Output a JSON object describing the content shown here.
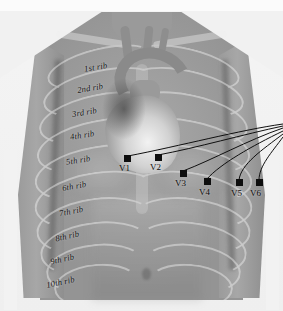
{
  "figure": {
    "kind": "anatomical-illustration",
    "color_scheme": {
      "background": "#f2f2f2",
      "skin": "#9d9d9d",
      "bone_overlay": "#eeeeee",
      "electrode": "#0e0e0e",
      "lead_wire": "#101010",
      "label_text": "#141414"
    }
  },
  "rib_labels": [
    {
      "text": "1st rib",
      "x": 84,
      "y": 62,
      "rotate": -9
    },
    {
      "text": "2nd rib",
      "x": 77,
      "y": 83,
      "rotate": -9
    },
    {
      "text": "3rd rib",
      "x": 72,
      "y": 107,
      "rotate": -9
    },
    {
      "text": "4th rib",
      "x": 70,
      "y": 130,
      "rotate": -9
    },
    {
      "text": "5th rib",
      "x": 66,
      "y": 155,
      "rotate": -9
    },
    {
      "text": "6th rib",
      "x": 62,
      "y": 181,
      "rotate": -10
    },
    {
      "text": "7th rib",
      "x": 59,
      "y": 206,
      "rotate": -11
    },
    {
      "text": "8th rib",
      "x": 55,
      "y": 231,
      "rotate": -12
    },
    {
      "text": "9th rib",
      "x": 50,
      "y": 254,
      "rotate": -12
    },
    {
      "text": "10th rib",
      "x": 46,
      "y": 277,
      "rotate": -12
    }
  ],
  "electrodes": [
    {
      "id": "V1",
      "label": "V1",
      "x": 124,
      "y": 155,
      "label_x": 119,
      "label_y": 163
    },
    {
      "id": "V2",
      "label": "V2",
      "x": 155,
      "y": 154,
      "label_x": 150,
      "label_y": 162
    },
    {
      "id": "V3",
      "label": "V3",
      "x": 180,
      "y": 170,
      "label_x": 175,
      "label_y": 178
    },
    {
      "id": "V4",
      "label": "V4",
      "x": 204,
      "y": 178,
      "label_x": 199,
      "label_y": 187
    },
    {
      "id": "V5",
      "label": "V5",
      "x": 236,
      "y": 179,
      "label_x": 231,
      "label_y": 188
    },
    {
      "id": "V6",
      "label": "V6",
      "x": 256,
      "y": 179,
      "label_x": 250,
      "label_y": 188
    }
  ],
  "lead_wires": {
    "converge_point": {
      "x": 283,
      "y": 125
    },
    "paths": [
      "M 283 124 C 240 130, 180 146, 128 156",
      "M 283 126 C 245 134, 196 148, 158 155",
      "M 283 128 C 248 140, 212 160, 183 171",
      "M 283 131 C 252 146, 220 164, 207 179",
      "M 283 134 C 262 150, 241 164, 239 180",
      "M 283 137 C 272 152, 259 166, 259 180"
    ]
  },
  "ribcage_arcs": {
    "left": [
      {
        "x": 6,
        "y": 18,
        "w": 104,
        "h": 34,
        "rot": -14
      },
      {
        "x": 2,
        "y": 40,
        "w": 112,
        "h": 40,
        "rot": -13
      },
      {
        "x": -2,
        "y": 64,
        "w": 118,
        "h": 44,
        "rot": -12
      },
      {
        "x": -4,
        "y": 90,
        "w": 122,
        "h": 48,
        "rot": -11
      },
      {
        "x": -6,
        "y": 116,
        "w": 124,
        "h": 50,
        "rot": -10
      },
      {
        "x": -6,
        "y": 142,
        "w": 122,
        "h": 52,
        "rot": -9
      },
      {
        "x": -4,
        "y": 168,
        "w": 116,
        "h": 52,
        "rot": -8
      },
      {
        "x": 0,
        "y": 192,
        "w": 108,
        "h": 50,
        "rot": -7
      },
      {
        "x": 6,
        "y": 214,
        "w": 96,
        "h": 46,
        "rot": -6
      },
      {
        "x": 14,
        "y": 234,
        "w": 82,
        "h": 40,
        "rot": -5
      }
    ],
    "right": [
      {
        "x": 93,
        "y": 18,
        "w": 104,
        "h": 34,
        "rot": 14
      },
      {
        "x": 89,
        "y": 40,
        "w": 112,
        "h": 40,
        "rot": 13
      },
      {
        "x": 87,
        "y": 64,
        "w": 118,
        "h": 44,
        "rot": 12
      },
      {
        "x": 85,
        "y": 90,
        "w": 122,
        "h": 48,
        "rot": 11
      },
      {
        "x": 85,
        "y": 116,
        "w": 124,
        "h": 50,
        "rot": 10
      },
      {
        "x": 87,
        "y": 142,
        "w": 122,
        "h": 52,
        "rot": 9
      },
      {
        "x": 91,
        "y": 168,
        "w": 116,
        "h": 52,
        "rot": 8
      },
      {
        "x": 95,
        "y": 192,
        "w": 108,
        "h": 50,
        "rot": 7
      },
      {
        "x": 101,
        "y": 214,
        "w": 96,
        "h": 46,
        "rot": 6
      },
      {
        "x": 107,
        "y": 234,
        "w": 82,
        "h": 40,
        "rot": 5
      }
    ]
  }
}
